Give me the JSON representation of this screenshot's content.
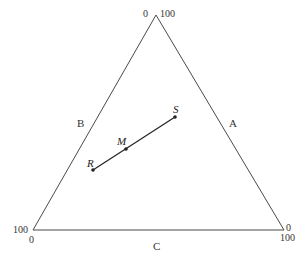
{
  "diagram": {
    "type": "ternary",
    "axes": {
      "A": {
        "label": "A"
      },
      "B": {
        "label": "B"
      },
      "C": {
        "label": "C"
      }
    },
    "vertex_ticks": {
      "top_left": "0",
      "top_right": "100",
      "bottom_left_outer": "100",
      "bottom_left_inner": "0",
      "bottom_right_outer": "0",
      "bottom_right_inner": "100"
    },
    "points": [
      {
        "name": "R",
        "label": "R"
      },
      {
        "name": "M",
        "label": "M"
      },
      {
        "name": "S",
        "label": "S"
      }
    ],
    "line": {
      "from": "R",
      "to": "S",
      "through": "M"
    },
    "colors": {
      "stroke": "#4a4a4a",
      "segment": "#222222",
      "background": "#ffffff"
    }
  }
}
